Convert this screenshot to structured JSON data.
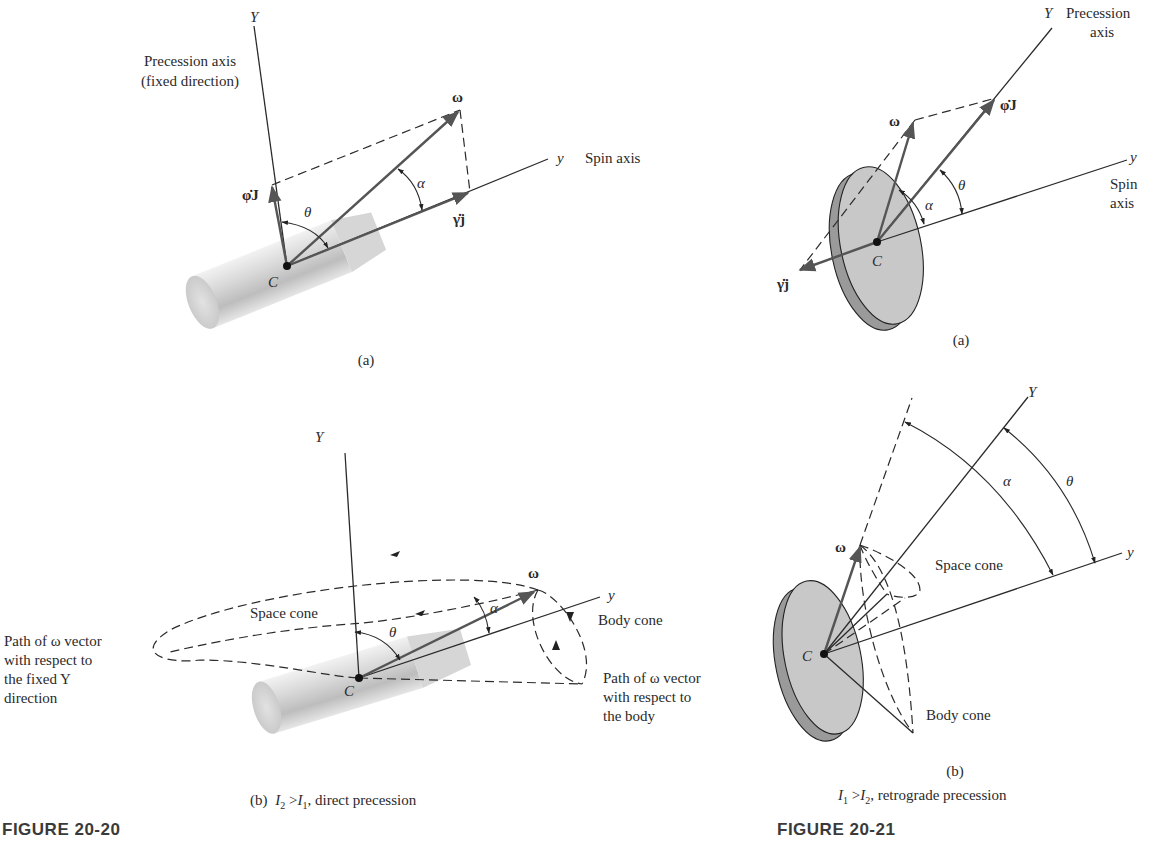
{
  "figure_20_20": {
    "label": "FIGURE 20-20",
    "panel_a": {
      "caption": "(a)",
      "precession_axis_label": "Precession axis",
      "precession_axis_sublabel": "(fixed direction)",
      "Y_axis": "Y",
      "y_axis": "y",
      "spin_axis_label": "Spin axis",
      "omega": "ω",
      "phi_dot_J": "φ̇J",
      "gamma_dot_j": "γ̇j",
      "alpha": "α",
      "theta": "θ",
      "center": "C"
    },
    "panel_b": {
      "caption_prefix": "(b)",
      "caption_I_a": "I",
      "caption_sub_a": "2",
      "caption_gt": " >",
      "caption_I_b": "I",
      "caption_sub_b": "1",
      "caption_suffix": ", direct precession",
      "Y_axis": "Y",
      "y_axis": "y",
      "omega": "ω",
      "alpha": "α",
      "theta": "θ",
      "center": "C",
      "space_cone": "Space cone",
      "body_cone": "Body cone",
      "path_fixed_lines": [
        "Path of ω vector",
        "with respect to",
        "the fixed Y",
        "direction"
      ],
      "path_body_lines": [
        "Path of ω vector",
        "with respect to",
        "the body"
      ]
    }
  },
  "figure_20_21": {
    "label": "FIGURE 20-21",
    "panel_a": {
      "caption": "(a)",
      "Y_axis": "Y",
      "precession_label": "Precession",
      "precession_sublabel": "axis",
      "y_axis": "y",
      "spin_label": "Spin",
      "spin_sublabel": "axis",
      "omega": "ω",
      "phi_dot_J": "φ̇J",
      "gamma_dot_j": "γ̇j",
      "alpha": "α",
      "theta": "θ",
      "center": "C"
    },
    "panel_b": {
      "caption": "(b)",
      "caption_I_a": "I",
      "caption_sub_a": "1",
      "caption_gt": " >",
      "caption_I_b": "I",
      "caption_sub_b": "2",
      "caption_suffix": ", retrograde precession",
      "Y_axis": "Y",
      "y_axis": "y",
      "omega": "ω",
      "alpha": "α",
      "theta": "θ",
      "center": "C",
      "space_cone": "Space cone",
      "body_cone": "Body cone"
    }
  }
}
